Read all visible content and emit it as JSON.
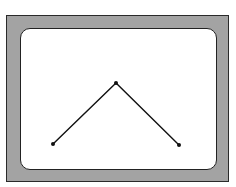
{
  "diagram": {
    "colors": {
      "frame_fill": "#a3a3a3",
      "frame_border": "#2a2a2a",
      "screen_fill": "#ffffff",
      "line": "#111111"
    },
    "points": [
      {
        "id": "left",
        "x": 53,
        "y": 144
      },
      {
        "id": "apex",
        "x": 116,
        "y": 83
      },
      {
        "id": "right",
        "x": 179,
        "y": 145
      }
    ]
  }
}
